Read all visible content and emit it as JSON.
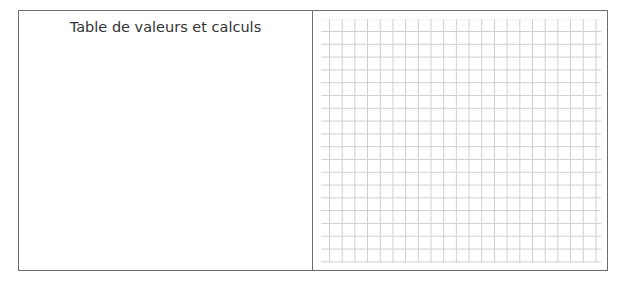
{
  "left_panel": {
    "title": "Table de valeurs et calculs"
  },
  "right_panel": {
    "type": "graph-paper-grid",
    "columns": 22,
    "rows": 18
  }
}
